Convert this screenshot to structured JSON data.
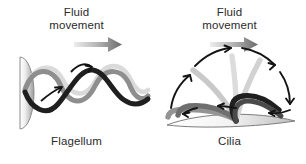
{
  "figure": {
    "background_color": "#ffffff",
    "width": 306,
    "height": 164
  },
  "panels": [
    {
      "id": "flagellum",
      "fluid_label": "Fluid\nmovement",
      "structure_label": "Flagellum",
      "fluid_arrow": {
        "name": "fluid-movement-arrow",
        "direction": "right",
        "gradient_from": "#e8e8e8",
        "gradient_to": "#6e6e6e"
      },
      "cell_body": {
        "name": "cell-body",
        "shape": "half-ellipse",
        "fill_light": "#f2f2f2",
        "fill_dark": "#9a9a9a",
        "outline": "#8a8a8a"
      },
      "waves": [
        {
          "name": "flagellum-wave-dark",
          "color": "#1f1f1f",
          "phase_label": "current"
        },
        {
          "name": "flagellum-wave-mid",
          "color": "#8e8e8e",
          "phase_label": "previous"
        },
        {
          "name": "flagellum-wave-light",
          "color": "#d8d8d8",
          "phase_label": "earliest"
        }
      ],
      "motion_arrows": [
        {
          "name": "wave-motion-arrow-lower",
          "direction": "up-right",
          "color": "#141414"
        },
        {
          "name": "wave-motion-arrow-upper",
          "direction": "down-right",
          "color": "#141414"
        }
      ]
    },
    {
      "id": "cilia",
      "fluid_label": "Fluid\nmovement",
      "structure_label": "Cilia",
      "fluid_arrow": {
        "name": "fluid-movement-arrow",
        "direction": "right",
        "gradient_from": "#e8e8e8",
        "gradient_to": "#6e6e6e"
      },
      "cell_surface": {
        "name": "cell-surface",
        "shape": "lens",
        "fill_light": "#fbfbfb",
        "fill_dark": "#b5b5b5",
        "outline": "#7d7d7d"
      },
      "cilia_strokes": [
        {
          "name": "cilium-dark",
          "color": "#1f1f1f",
          "phase_label": "power-stroke"
        },
        {
          "name": "cilium-mid-dark",
          "color": "#6b6b6b",
          "phase_label": "power-stroke"
        },
        {
          "name": "cilium-mid",
          "color": "#8e8e8e",
          "phase_label": "recovery"
        },
        {
          "name": "cilium-light",
          "color": "#c4c4c4",
          "phase_label": "recovery"
        },
        {
          "name": "cilium-lightest",
          "color": "#dcdcdc",
          "phase_label": "recovery"
        }
      ],
      "motion_arrows": [
        {
          "name": "cilia-motion-arrow-left-up",
          "direction": "up-right",
          "color": "#141414"
        },
        {
          "name": "cilia-motion-arrow-top-left",
          "direction": "right",
          "color": "#141414"
        },
        {
          "name": "cilia-motion-arrow-top-right",
          "direction": "down-right",
          "color": "#141414"
        },
        {
          "name": "cilia-motion-arrow-right-down",
          "direction": "down",
          "color": "#141414"
        },
        {
          "name": "cilia-motion-arrow-base-right",
          "direction": "left",
          "color": "#141414"
        },
        {
          "name": "cilia-motion-arrow-base-mid",
          "direction": "left",
          "color": "#141414"
        },
        {
          "name": "cilia-motion-arrow-base-left",
          "direction": "left",
          "color": "#141414"
        }
      ]
    }
  ]
}
